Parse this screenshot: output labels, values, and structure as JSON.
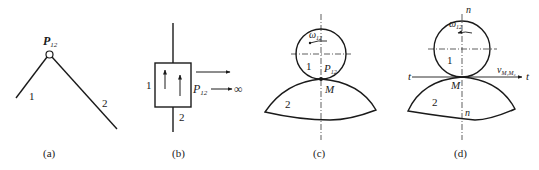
{
  "figures": [
    {
      "id": "a",
      "caption": "(a)",
      "labels": {
        "pole": "P",
        "pole_sub": "12",
        "link1": "1",
        "link2": "2"
      }
    },
    {
      "id": "b",
      "caption": "(b)",
      "labels": {
        "pole": "P",
        "pole_sub": "12",
        "infinity": "∞",
        "link1": "1",
        "link2": "2"
      }
    },
    {
      "id": "c",
      "caption": "(c)",
      "labels": {
        "omega": "ω",
        "omega_sub": "12",
        "link1": "1",
        "pole": "P",
        "pole_sub": "12",
        "contact": "M",
        "link2": "2"
      }
    },
    {
      "id": "d",
      "caption": "(d)",
      "labels": {
        "normal_top": "n",
        "normal_bottom": "n",
        "omega": "ω",
        "omega_sub": "12",
        "link1": "1",
        "tangent_left": "t",
        "tangent_right": "t",
        "velocity": "v",
        "velocity_sub": "M₁M₂",
        "contact": "M",
        "link2": "2"
      }
    }
  ],
  "colors": {
    "ink": "#1a1a1a",
    "background": "#ffffff"
  }
}
